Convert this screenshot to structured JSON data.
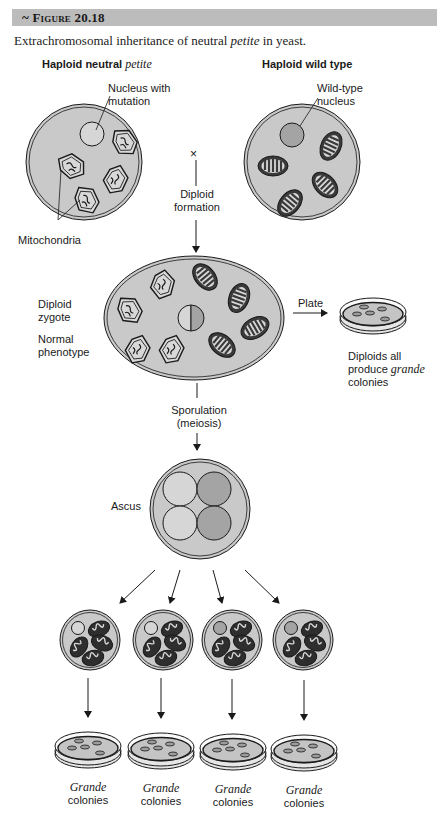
{
  "figure": {
    "number_label": "~ Figure 20.18",
    "caption_prefix": "Extrachromosomal inheritance of neutral ",
    "caption_italic": "petite",
    "caption_suffix": " in yeast."
  },
  "parents": {
    "left_title_prefix": "Haploid neutral ",
    "left_title_italic": "petite",
    "right_title": "Haploid wild type",
    "nucleus_with_mutation_line1": "Nucleus with",
    "nucleus_with_mutation_line2": "mutation",
    "wildtype_nucleus_line1": "Wild-type",
    "wildtype_nucleus_line2": "nucleus",
    "mitochondria_label": "Mitochondria",
    "cross_symbol": "×"
  },
  "steps": {
    "diploid_formation_line1": "Diploid",
    "diploid_formation_line2": "formation",
    "diploid_zygote_line1": "Diploid",
    "diploid_zygote_line2": "zygote",
    "normal_phenotype_line1": "Normal",
    "normal_phenotype_line2": "phenotype",
    "plate_label": "Plate",
    "diploids_result_line1": "Diploids all",
    "diploids_result_line2_prefix": "produce ",
    "diploids_result_line2_italic": "grande",
    "diploids_result_line3": "colonies",
    "sporulation_line1": "Sporulation",
    "sporulation_line2": "(meiosis)",
    "ascus_label": "Ascus"
  },
  "progeny": [
    {
      "nucleus": "mutant",
      "result_italic": "Grande",
      "result_text": "colonies"
    },
    {
      "nucleus": "mutant",
      "result_italic": "Grande",
      "result_text": "colonies"
    },
    {
      "nucleus": "wild-type",
      "result_italic": "Grande",
      "result_text": "colonies"
    },
    {
      "nucleus": "wild-type",
      "result_italic": "Grande",
      "result_text": "colonies"
    }
  ],
  "colors": {
    "cell_fill": "#c9c9c9",
    "wildtype_nucleus": "#a4a4a4",
    "mutant_nucleus": "#d6d6d6",
    "mito_dark": "#3a3a3a",
    "header_bar": "#bcbcbc"
  }
}
